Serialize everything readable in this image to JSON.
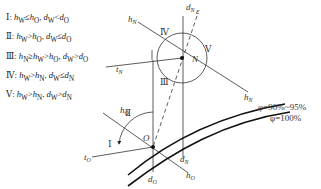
{
  "legend": [
    {
      "zone": "Ⅰ",
      "condition": "hW≤hO, dW<dO"
    },
    {
      "zone": "Ⅱ",
      "condition": "hW>hO, dW≤dO"
    },
    {
      "zone": "Ⅲ",
      "condition": "hN≥hW>hO, dW>dO"
    },
    {
      "zone": "Ⅳ",
      "condition": "hW>hN, dW≤dN"
    },
    {
      "zone": "Ⅴ",
      "condition": "hW>hN, dW>dN"
    }
  ],
  "points": {
    "O": "O",
    "N": "N"
  },
  "zone_labels": {
    "I": "Ⅰ",
    "II": "Ⅱ",
    "III": "Ⅲ",
    "IV": "Ⅳ",
    "V": "Ⅴ"
  },
  "axis_labels": {
    "hN_top": "hN",
    "hN_bottom": "hN",
    "dN_top": "dN",
    "dN_bottom": "dN",
    "tN": "tN",
    "epsilon": "ε",
    "hO_top": "hO",
    "hO_bottom": "hO",
    "tO": "tO",
    "dO": "dO"
  },
  "curves": [
    {
      "label": "φ=90%~95%"
    },
    {
      "label": "φ=100%"
    }
  ]
}
